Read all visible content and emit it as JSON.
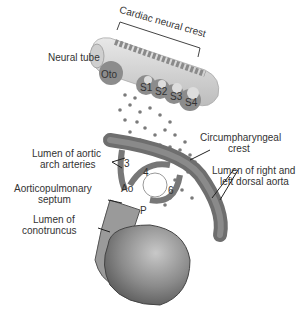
{
  "labels": {
    "cardiac_neural_crest": "Cardiac neural crest",
    "neural_tube": "Neural tube",
    "oto": "Oto",
    "s1": "S1",
    "s2": "S2",
    "s3": "S3",
    "s4": "S4",
    "circumpharyngeal_1": "Circumpharyngeal",
    "circumpharyngeal_2": "crest",
    "aortic_arch_1": "Lumen of aortic",
    "aortic_arch_2": "arch arteries",
    "dorsal_aorta_1": "Lumen of right and",
    "dorsal_aorta_2": "left dorsal aorta",
    "ap_septum_1": "Aorticopulmonary",
    "ap_septum_2": "septum",
    "conotruncus_1": "Lumen of",
    "conotruncus_2": "conotruncus",
    "arch3": "3",
    "arch4": "4",
    "arch6": "6",
    "ao": "Ao",
    "p": "P"
  },
  "colors": {
    "tube": "#d9d9d9",
    "somite": "#8c8c8c",
    "cell": "#7a7a7a",
    "vessel": "#6e6e6e",
    "heart": "#9a9a9a"
  }
}
